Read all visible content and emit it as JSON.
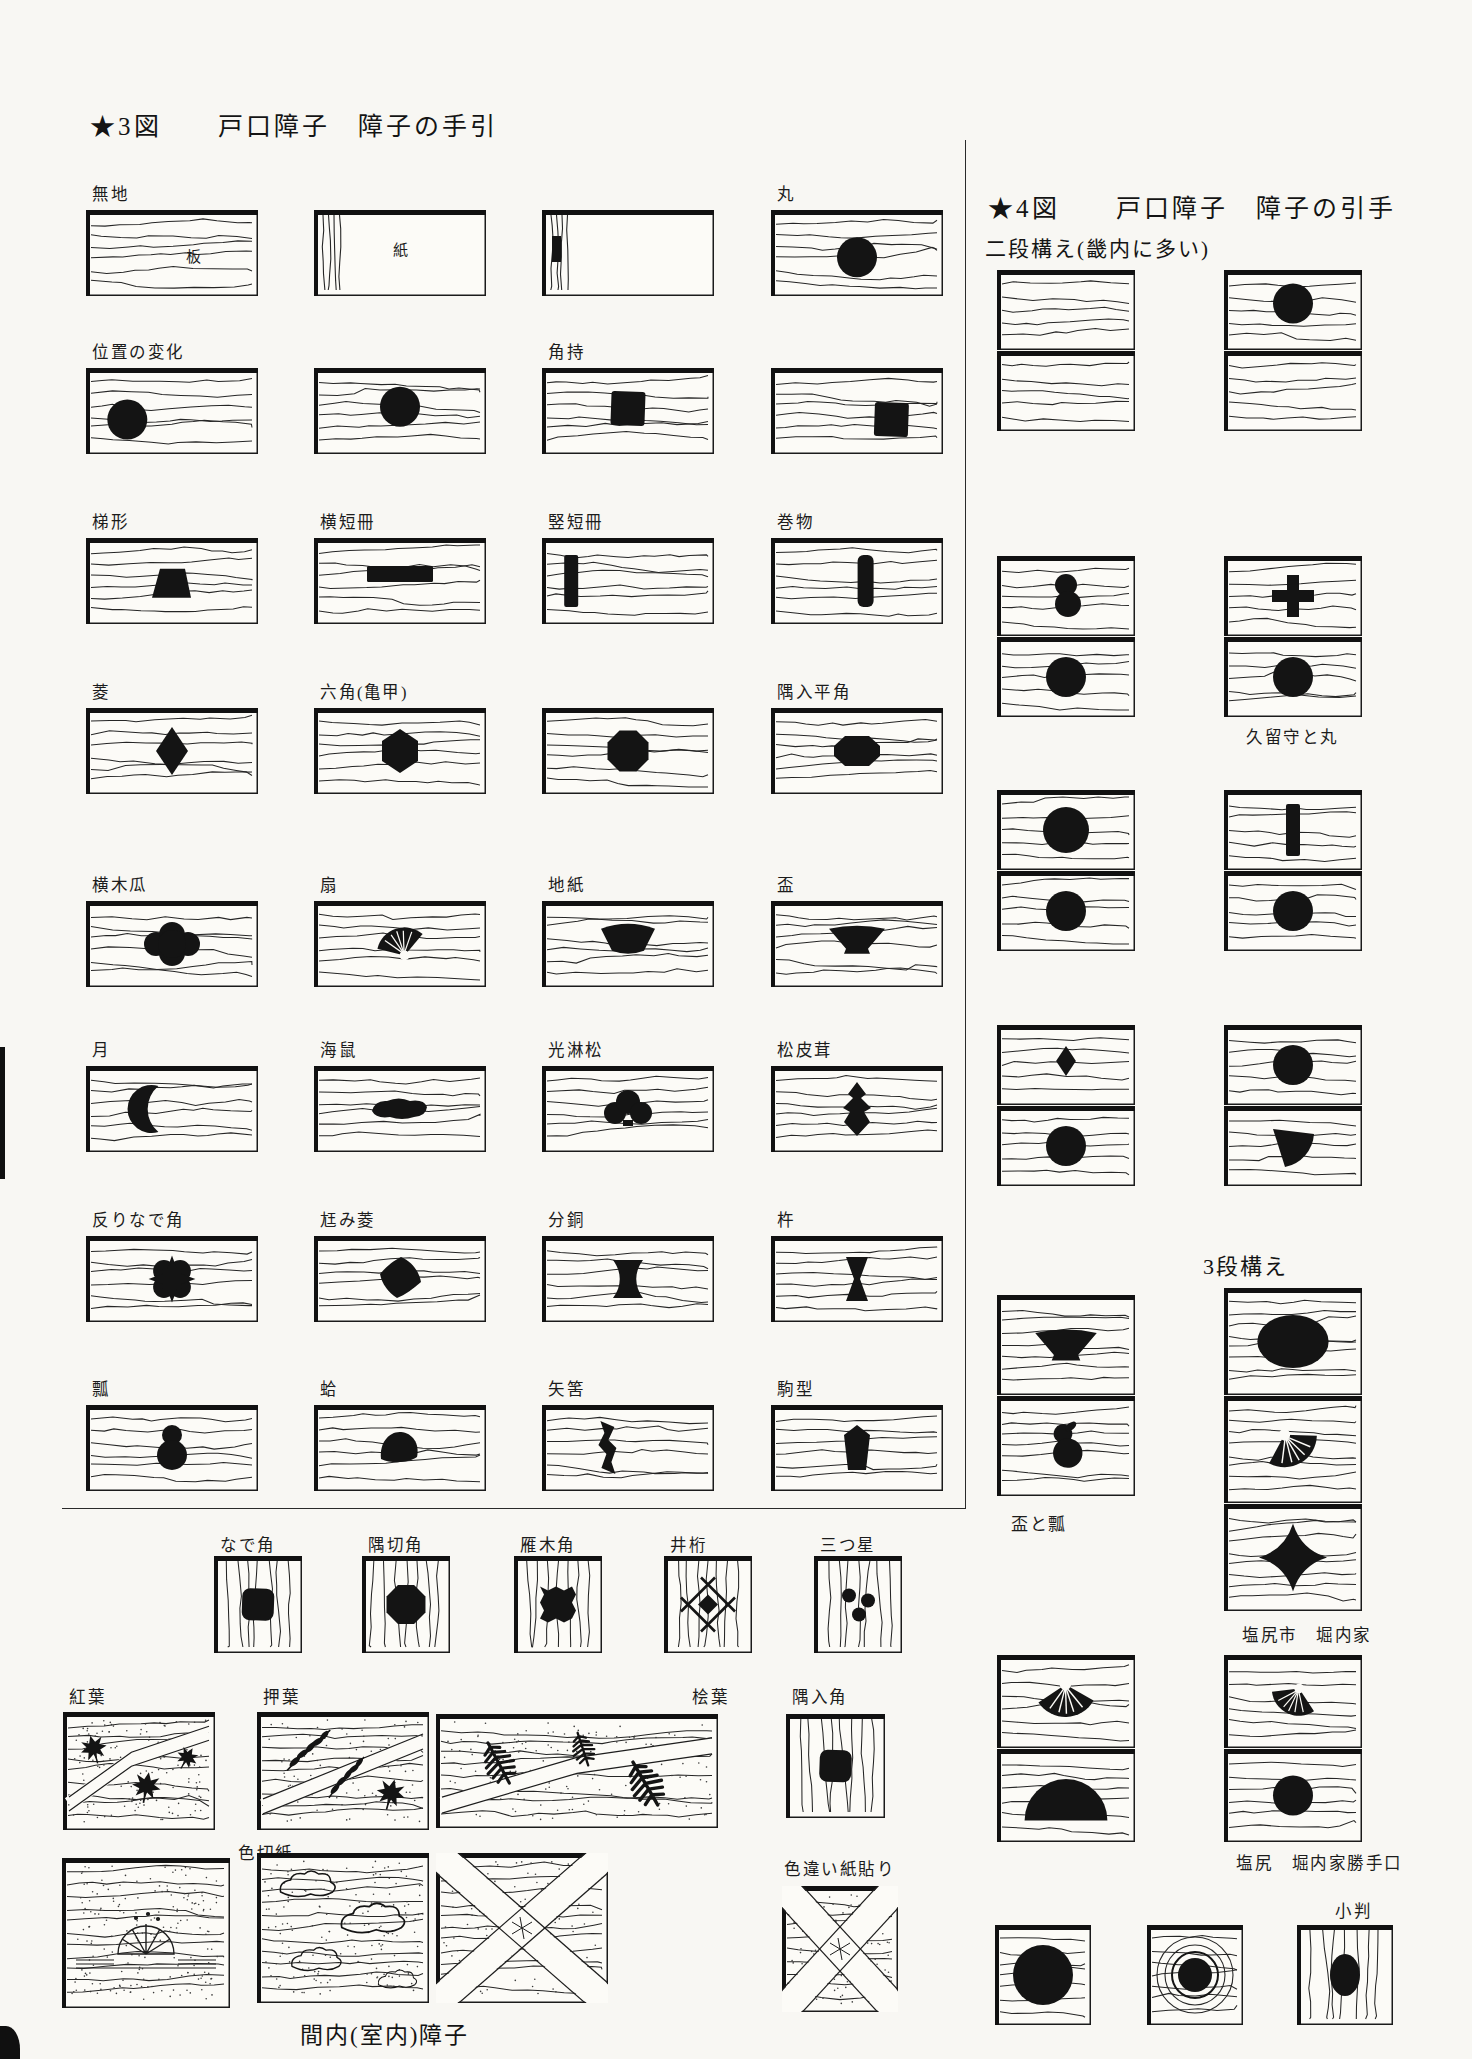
{
  "page": {
    "background": "#f8f7f3",
    "ink": "#141414"
  },
  "fig3": {
    "title": "★3図　　戸口障子　障子の手引",
    "rows": [
      {
        "cells": [
          {
            "label": "無地",
            "grain": "h",
            "note": "板",
            "nx": 0.58,
            "ny": 0.6
          },
          {
            "grain": "paper",
            "note": "紙",
            "nx": 0.46,
            "ny": 0.52
          },
          {
            "grain": "paper",
            "mark": true
          },
          {
            "label": "丸",
            "grain": "h",
            "shape": "circle",
            "cy": 0.55
          }
        ]
      },
      {
        "cells": [
          {
            "label": "位置の変化",
            "shape": "circle",
            "cx": 0.24,
            "cy": 0.6
          },
          {
            "shape": "circle",
            "cy": 0.45
          },
          {
            "label": "角持",
            "shape": "square",
            "cy": 0.47
          },
          {
            "shape": "square",
            "cx": 0.7,
            "cy": 0.6
          }
        ]
      },
      {
        "cells": [
          {
            "label": "梯形",
            "shape": "trapezoid",
            "cy": 0.52
          },
          {
            "label": "横短冊",
            "shape": "hbar",
            "cy": 0.42
          },
          {
            "label": "竪短冊",
            "shape": "vbar",
            "cx": 0.17
          },
          {
            "label": "巻物",
            "shape": "scroll",
            "cx": 0.55
          }
        ]
      },
      {
        "cells": [
          {
            "label": "菱",
            "shape": "diamond"
          },
          {
            "label": "六角(亀甲)",
            "shape": "hexagon"
          },
          {
            "shape": "octagon"
          },
          {
            "label": "隅入平角",
            "shape": "notched-square"
          }
        ]
      },
      {
        "cells": [
          {
            "label": "横木瓜",
            "shape": "mokko"
          },
          {
            "label": "扇",
            "shape": "fan",
            "rot": -18,
            "s": 0.82,
            "cy": 0.47
          },
          {
            "label": "地紙",
            "shape": "jigami",
            "cy": 0.45
          },
          {
            "label": "盃",
            "shape": "cup",
            "cy": 0.45
          }
        ]
      },
      {
        "cells": [
          {
            "label": "月",
            "shape": "crescent",
            "cx": 0.38
          },
          {
            "label": "海鼠",
            "shape": "namako"
          },
          {
            "label": "光淋松",
            "shape": "korin"
          },
          {
            "label": "松皮茸",
            "shape": "matsukawa"
          }
        ]
      },
      {
        "cells": [
          {
            "label": "反りなで角",
            "shape": "sorinade",
            "s": 0.9
          },
          {
            "label": "尪み菱",
            "shape": "yugami"
          },
          {
            "label": "分銅",
            "shape": "fundo"
          },
          {
            "label": "杵",
            "shape": "kine"
          }
        ]
      },
      {
        "cells": [
          {
            "label": "瓢",
            "shape": "hyotan"
          },
          {
            "label": "蛤",
            "shape": "hamaguri"
          },
          {
            "label": "矢筈",
            "shape": "yahazu",
            "cx": 0.38
          },
          {
            "label": "駒型",
            "shape": "koma"
          }
        ]
      }
    ]
  },
  "fig4": {
    "title": "★4図　　戸口障子　障子の引手",
    "subtitle": "二段構え(畿内に多い)",
    "heading_3dan": "3段構え",
    "groups": [
      {
        "left": [
          null,
          null
        ],
        "right": [
          {
            "shape": "circle",
            "cy": 0.42
          },
          null
        ],
        "caption": ""
      },
      {
        "left": [
          {
            "shape": "dcircle"
          },
          {
            "shape": "circle"
          }
        ],
        "right": [
          {
            "shape": "cross"
          },
          {
            "shape": "circle"
          }
        ],
        "caption": "久留守と丸"
      },
      {
        "left": [
          {
            "shape": "circle",
            "s": 1.15
          },
          {
            "shape": "circle"
          }
        ],
        "right": [
          {
            "shape": "vbar"
          },
          {
            "shape": "circle"
          }
        ],
        "caption": ""
      },
      {
        "left": [
          {
            "shape": "diamond",
            "s": 0.62,
            "cy": 0.45
          },
          {
            "shape": "circle"
          }
        ],
        "right": [
          {
            "shape": "circle"
          },
          {
            "shape": "fanleaf"
          }
        ],
        "caption": ""
      }
    ],
    "group_sakazuki": {
      "left": [
        {
          "shape": "cup",
          "s": 1.1
        },
        {
          "shape": "hyotan2",
          "s": 1.05
        }
      ],
      "left_caption": "盃と瓢",
      "right": [
        {
          "shape": "oval",
          "s": 1.15
        },
        {
          "shape": "fan",
          "rot": 150,
          "s": 0.95
        },
        {
          "shape": "star4"
        }
      ],
      "right_caption": "塩尻市　堀内家"
    },
    "group_shiojiri": {
      "left": [
        {
          "shape": "fan",
          "rot": 178,
          "s": 0.95
        },
        {
          "shape": "dome",
          "s": 1.15,
          "cy": 0.52
        }
      ],
      "right": [
        {
          "shape": "fan",
          "rot": 205,
          "s": 0.8
        },
        {
          "shape": "circle"
        }
      ],
      "caption": "塩尻　堀内家勝手口"
    },
    "bottom_squares": [
      {
        "shape": "circle",
        "s": 1.5,
        "grain": "h"
      },
      {
        "shape": "donut",
        "grain": "rings"
      },
      {
        "label": "小判",
        "shape": "ovalv",
        "grain": "v"
      }
    ]
  },
  "bottom": {
    "corner_squares": [
      {
        "label": "なで角",
        "shape": "rounded-square",
        "grain": "v"
      },
      {
        "label": "隅切角",
        "shape": "octagon",
        "grain": "v",
        "s": 0.95
      },
      {
        "label": "雁木角",
        "shape": "jagged",
        "grain": "v"
      },
      {
        "label": "井桁",
        "shape": "igeta",
        "grain": "v"
      },
      {
        "label": "三つ星",
        "shape": "mitsuboshi",
        "grain": "v"
      }
    ],
    "paper_panels": [
      {
        "label": "紅葉",
        "decor": "momiji"
      },
      {
        "label": "押葉",
        "decor": "oshiba"
      },
      {
        "label": "桧葉",
        "decor": "hiba",
        "label_align": "right"
      },
      {
        "label": "隅入角",
        "shape": "rounded-square",
        "grain": "v"
      }
    ],
    "paper_panels2": [
      {
        "label": "色切紙",
        "decor": "kirigami"
      },
      {
        "decor": "kumo"
      },
      {
        "decor": "xband"
      },
      {
        "label": "色違い紙貼り",
        "decor": "xband"
      }
    ],
    "caption": "間内(室内)障子"
  }
}
